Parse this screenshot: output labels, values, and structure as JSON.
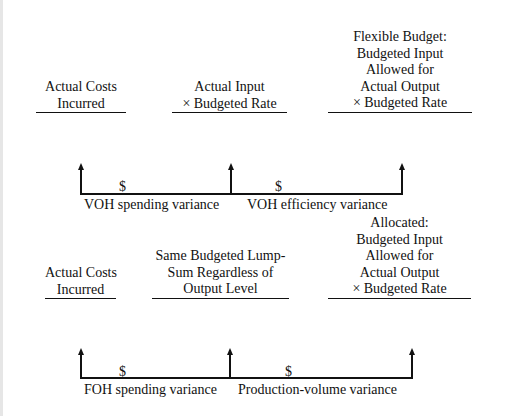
{
  "variable_overhead": {
    "columns": [
      {
        "lines": [
          "Actual Costs",
          "Incurred"
        ]
      },
      {
        "lines": [
          "Actual Input",
          "× Budgeted Rate"
        ]
      },
      {
        "lines": [
          "Flexible Budget:",
          "Budgeted Input",
          "Allowed for",
          "Actual Output",
          "× Budgeted Rate"
        ]
      }
    ],
    "variances": [
      {
        "amount_symbol": "$",
        "label": "VOH spending variance"
      },
      {
        "amount_symbol": "$",
        "label": "VOH efficiency variance"
      }
    ]
  },
  "fixed_overhead": {
    "columns": [
      {
        "lines": [
          "Actual Costs",
          "Incurred"
        ]
      },
      {
        "lines": [
          "Same Budgeted Lump-",
          "Sum Regardless of",
          "Output Level"
        ]
      },
      {
        "lines": [
          "Allocated:",
          "Budgeted Input",
          "Allowed for",
          "Actual Output",
          "× Budgeted Rate"
        ]
      }
    ],
    "variances": [
      {
        "amount_symbol": "$",
        "label": "FOH spending variance"
      },
      {
        "amount_symbol": "$",
        "label": "Production-volume variance"
      }
    ]
  }
}
